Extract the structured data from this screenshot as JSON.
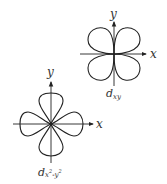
{
  "diagrams": [
    {
      "id": "dxy",
      "orbital_label": "d",
      "orbital_subscript": "xy",
      "x_axis_label": "x",
      "y_axis_label": "y",
      "lobe_orientation": "between axes (diagonal)"
    },
    {
      "id": "dx2-y2",
      "orbital_label": "d",
      "orbital_subscript_parts": [
        "x",
        "2",
        "-y",
        "2"
      ],
      "x_axis_label": "x",
      "y_axis_label": "y",
      "lobe_orientation": "along axes"
    }
  ]
}
